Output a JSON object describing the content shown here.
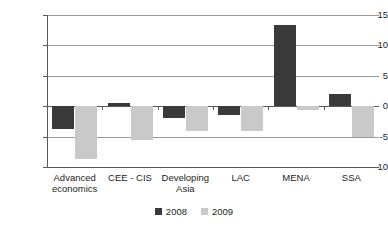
{
  "chart_data": {
    "type": "bar",
    "title": "",
    "subtitle": "",
    "xlabel": "",
    "ylabel": "",
    "categories": [
      "Advanced economics",
      "CEE - CIS",
      "Developing Asia",
      "LAC",
      "MENA",
      "SSA"
    ],
    "series": [
      {
        "name": "2008",
        "color": "#3a3a3a",
        "values": [
          -3.8,
          0.6,
          -2.0,
          -1.4,
          13.4,
          2.0
        ]
      },
      {
        "name": "2009",
        "color": "#c9c9c9",
        "values": [
          -8.7,
          -5.5,
          -4.0,
          -4.0,
          -0.7,
          -5.1
        ]
      }
    ],
    "ylim": [
      -10,
      15
    ],
    "yticks": [
      15,
      10,
      5,
      0,
      -5,
      -10
    ],
    "ytick_labels": [
      "15",
      "10",
      "5",
      "0",
      "-5",
      "-10"
    ],
    "grid": true,
    "grid_axis": "y",
    "legend_position": "bottom",
    "legend": [
      "2008",
      "2009"
    ]
  },
  "axis": {
    "ticks": [
      {
        "label": "15",
        "value": 15
      },
      {
        "label": "10",
        "value": 10
      },
      {
        "label": "5",
        "value": 5
      },
      {
        "label": "0",
        "value": 0
      },
      {
        "label": "-5",
        "value": -5
      },
      {
        "label": "-10",
        "value": -10
      }
    ]
  },
  "categories_display": [
    {
      "line1": "Advanced",
      "line2": "economics"
    },
    {
      "line1": "CEE - CIS",
      "line2": ""
    },
    {
      "line1": "Developing",
      "line2": "Asia"
    },
    {
      "line1": "LAC",
      "line2": ""
    },
    {
      "line1": "MENA",
      "line2": ""
    },
    {
      "line1": "SSA",
      "line2": ""
    }
  ],
  "legend": {
    "items": [
      {
        "label": "2008",
        "color": "#3a3a3a"
      },
      {
        "label": "2009",
        "color": "#c9c9c9"
      }
    ]
  },
  "colors": {
    "series_2008": "#3a3a3a",
    "series_2009": "#c9c9c9",
    "axis": "#58595b",
    "grid": "#9a9a9a",
    "text": "#231f20",
    "background": "#ffffff"
  }
}
